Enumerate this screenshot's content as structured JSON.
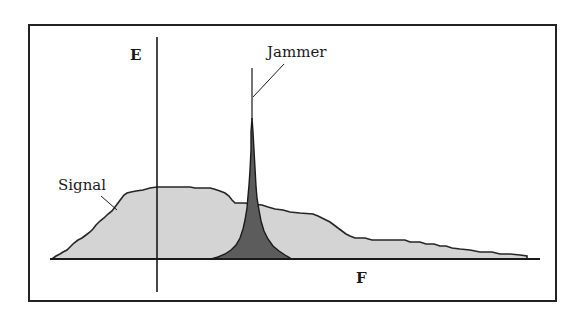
{
  "diagram": {
    "type": "spectrum-illustration",
    "labels": {
      "y_axis": "E",
      "x_axis": "F",
      "signal": "Signal",
      "jammer": "Jammer"
    },
    "colors": {
      "border": "#222222",
      "axis": "#1a1a1a",
      "signal_fill": "#d4d4d4",
      "signal_outline": "#262626",
      "jammer_fill": "#5c5c5c",
      "jammer_outline": "#1a1a1a"
    }
  }
}
